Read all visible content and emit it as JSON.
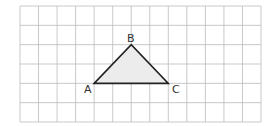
{
  "grid": {
    "columns": 13,
    "rows": 6,
    "x0": 20,
    "y0": 6,
    "x1": 261,
    "y1": 122,
    "line_color": "#bbbbbb"
  },
  "triangle": {
    "fill": "#ececec",
    "stroke": "#222222",
    "vertices": [
      {
        "label": "A",
        "col": 4,
        "row": 4
      },
      {
        "label": "B",
        "col": 6,
        "row": 2
      },
      {
        "label": "C",
        "col": 8,
        "row": 4
      }
    ]
  },
  "labels": {
    "a": "A",
    "b": "B",
    "c": "C"
  }
}
